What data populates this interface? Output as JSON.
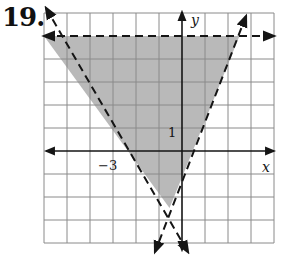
{
  "problem": {
    "number": "19."
  },
  "graph": {
    "x_label": "x",
    "y_label": "y",
    "tick_labels": {
      "x_minus3": "−3",
      "y_1": "1"
    },
    "grid": {
      "x_min": -6,
      "x_max": 4,
      "y_min": -4,
      "y_max": 6
    },
    "colors": {
      "shade": "#b9b9b9",
      "grid": "#8a8a8a",
      "line": "#151515",
      "background": "#ffffff"
    },
    "boundaries": [
      {
        "name": "horizontal",
        "style": "dashed",
        "description": "y = 5"
      },
      {
        "name": "left",
        "style": "dashed",
        "description": "through (-3,0) and (-6,5)"
      },
      {
        "name": "right",
        "style": "dashed",
        "description": "through (0,-1) and (2.5,5)"
      }
    ],
    "shaded_region": "triangle bounded by the three dashed lines"
  }
}
